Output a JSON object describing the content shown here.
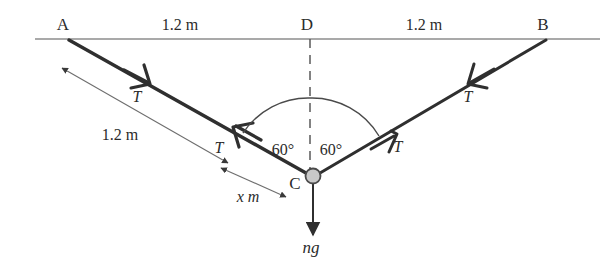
{
  "figure": {
    "colors": {
      "ink": "#2b2b2b",
      "string": "#2f2f2f",
      "rail": "#8c8c8c",
      "dimension": "#6e6e6e",
      "dashed": "#5a5a5a",
      "bead_fill": "#c9c9c9",
      "bead_stroke": "#4a4a4a",
      "background": "#ffffff"
    },
    "points": [
      {
        "name": "point-a",
        "label": "A",
        "x": 63,
        "y": 30
      },
      {
        "name": "point-d",
        "label": "D",
        "x": 307,
        "y": 30
      },
      {
        "name": "point-b",
        "label": "B",
        "x": 543,
        "y": 30
      },
      {
        "name": "point-c",
        "label": "C",
        "x": 295,
        "y": 189
      }
    ],
    "dimensions": [
      {
        "name": "length-ad",
        "label": "1.2 m",
        "x": 180,
        "y": 30
      },
      {
        "name": "length-db",
        "label": "1.2 m",
        "x": 424,
        "y": 30
      },
      {
        "name": "length-ac",
        "label": "1.2 m",
        "x": 120,
        "y": 140
      },
      {
        "name": "length-xc",
        "label": "x m",
        "x": 248,
        "y": 202
      }
    ],
    "angles": [
      {
        "name": "angle-left",
        "label": "60°",
        "x": 283,
        "y": 155
      },
      {
        "name": "angle-right",
        "label": "60°",
        "x": 331,
        "y": 155
      }
    ],
    "tensions": [
      {
        "name": "tension-upper-left",
        "label": "T",
        "x": 137,
        "y": 102
      },
      {
        "name": "tension-lower-left",
        "label": "T",
        "x": 219,
        "y": 153
      },
      {
        "name": "tension-upper-right",
        "label": "T",
        "x": 468,
        "y": 102
      },
      {
        "name": "tension-lower-right",
        "label": "T",
        "x": 398,
        "y": 152
      }
    ],
    "weight": {
      "name": "weight-force",
      "label": "ng",
      "x": 311,
      "y": 253
    },
    "bead": {
      "name": "bead",
      "cx": 313,
      "cy": 176,
      "r": 7.5
    }
  }
}
